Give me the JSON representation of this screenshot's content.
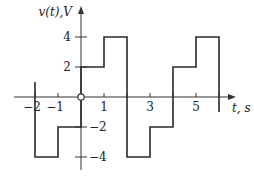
{
  "chart_data": {
    "type": "line",
    "title": "",
    "xlabel": "t, s",
    "ylabel": "v(t), V",
    "x_tick_labels": [
      "-2",
      "-1",
      "1",
      "3",
      "5"
    ],
    "x_ticks": [
      -2,
      -1,
      1,
      2,
      3,
      4,
      5,
      6
    ],
    "y_tick_labels": [
      "4",
      "2",
      "-2",
      "-4"
    ],
    "y_ticks": [
      4,
      2,
      -2,
      -4
    ],
    "xlim": [
      -2.8,
      7.2
    ],
    "ylim": [
      -5.2,
      6.0
    ],
    "grid": false,
    "legend": null,
    "series": [
      {
        "name": "v(t)",
        "style": "step",
        "points": [
          [
            -2,
            1
          ],
          [
            -2,
            -4
          ],
          [
            -1,
            -4
          ],
          [
            -1,
            -2
          ],
          [
            0,
            -2
          ],
          [
            0,
            2
          ],
          [
            1,
            2
          ],
          [
            1,
            4
          ],
          [
            2,
            4
          ],
          [
            2,
            -4
          ],
          [
            3,
            -4
          ],
          [
            3,
            -2
          ],
          [
            4,
            -2
          ],
          [
            4,
            2
          ],
          [
            5,
            2
          ],
          [
            5,
            4
          ],
          [
            6,
            4
          ],
          [
            6,
            -1
          ]
        ]
      }
    ],
    "annotations": [
      {
        "type": "open-circle",
        "x": 0,
        "y": 0
      }
    ]
  },
  "labels": {
    "ylabel": "v(t),V",
    "xlabel": "t, s",
    "x_ticks": [
      {
        "t": -2,
        "text": "−2"
      },
      {
        "t": -1,
        "text": "−1"
      },
      {
        "t": 1,
        "text": "1"
      },
      {
        "t": 3,
        "text": "3"
      },
      {
        "t": 5,
        "text": "5"
      }
    ],
    "y_ticks": [
      {
        "v": 4,
        "text": "4"
      },
      {
        "v": 2,
        "text": "2"
      },
      {
        "v": -2,
        "text": "−2"
      },
      {
        "v": -4,
        "text": "−4"
      }
    ]
  },
  "colors": {
    "line": "#2a2a2a",
    "axis": "#333333",
    "text": "#222222"
  }
}
